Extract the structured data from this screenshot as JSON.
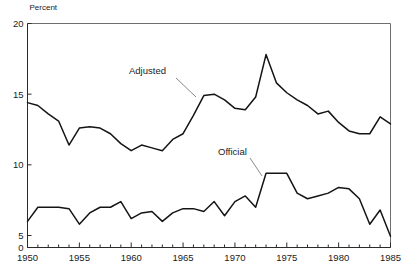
{
  "chart_data": {
    "type": "line",
    "title": "",
    "xlabel": "",
    "ylabel": "Percent",
    "unit_label": "Percent",
    "xlim": [
      1950,
      1985
    ],
    "ylim": [
      0,
      20
    ],
    "y_break": {
      "from": 0,
      "to": 5,
      "note": "compressed axis segment between 0 and 5"
    },
    "yticks": [
      0,
      5,
      10,
      15,
      20
    ],
    "ytick_labels": [
      "0",
      "5",
      "10",
      "15",
      "20"
    ],
    "xticks_major": [
      1950,
      1955,
      1960,
      1965,
      1970,
      1975,
      1980,
      1985
    ],
    "xtick_labels": [
      "1950",
      "1955",
      "1960",
      "1965",
      "1970",
      "1975",
      "1980",
      "1985"
    ],
    "xticks_minor_step": 1,
    "grid": false,
    "legend": "annotations-inline",
    "x": [
      1950,
      1951,
      1952,
      1953,
      1954,
      1955,
      1956,
      1957,
      1958,
      1959,
      1960,
      1961,
      1962,
      1963,
      1964,
      1965,
      1966,
      1967,
      1968,
      1969,
      1970,
      1971,
      1972,
      1973,
      1974,
      1975,
      1976,
      1977,
      1978,
      1979,
      1980,
      1981,
      1982,
      1983,
      1984,
      1985
    ],
    "series": [
      {
        "name": "Adjusted",
        "color": "#141414",
        "values": [
          14.4,
          14.2,
          13.6,
          13.1,
          11.4,
          12.6,
          12.7,
          12.6,
          12.2,
          11.5,
          11.0,
          11.4,
          11.2,
          11.0,
          11.8,
          12.2,
          13.5,
          14.9,
          15.0,
          14.6,
          14.0,
          13.9,
          14.8,
          17.8,
          15.8,
          15.1,
          14.6,
          14.2,
          13.6,
          13.8,
          13.0,
          12.4,
          12.2,
          12.2,
          13.4,
          12.9
        ]
      },
      {
        "name": "Official",
        "color": "#141414",
        "values": [
          6.0,
          7.0,
          7.0,
          7.0,
          6.9,
          5.8,
          6.6,
          7.0,
          7.0,
          7.4,
          6.2,
          6.6,
          6.7,
          6.0,
          6.6,
          6.9,
          6.9,
          6.7,
          7.4,
          6.4,
          7.4,
          7.8,
          7.0,
          9.4,
          9.4,
          9.4,
          8.0,
          7.6,
          7.8,
          8.0,
          8.4,
          8.3,
          7.6,
          5.8,
          6.8,
          4.7
        ]
      }
    ],
    "annotations": [
      {
        "text": "Adjusted",
        "series": "Adjusted",
        "label_x": 129,
        "label_y": 74,
        "leader_from_x": 176,
        "leader_from_y": 78,
        "leader_to_x": 196,
        "leader_to_y": 97
      },
      {
        "text": "Official",
        "series": "Official",
        "label_x": 218,
        "label_y": 155,
        "leader_from_x": 250,
        "leader_from_y": 158,
        "leader_to_x": 262,
        "leader_to_y": 176
      }
    ]
  }
}
